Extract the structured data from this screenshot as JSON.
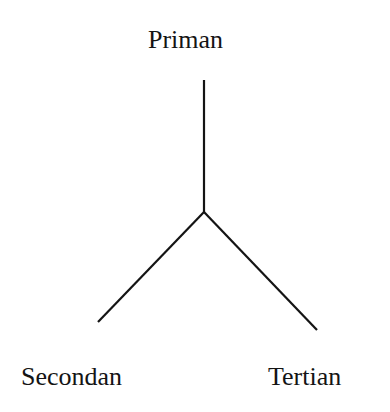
{
  "diagram": {
    "type": "tree",
    "nodes": {
      "top": "Priman",
      "left": "Secondan",
      "right": "Tertian"
    },
    "edges": [
      {
        "from": "top",
        "to": "junction"
      },
      {
        "from": "junction",
        "to": "left"
      },
      {
        "from": "junction",
        "to": "right"
      }
    ],
    "line_color": "#141414"
  }
}
